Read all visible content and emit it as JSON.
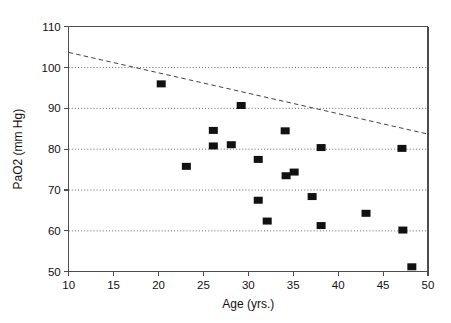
{
  "chart_data": {
    "type": "scatter",
    "title": "",
    "xlabel": "Age (yrs.)",
    "ylabel": "PaO2 (mm Hg)",
    "xlim": [
      10,
      50
    ],
    "ylim": [
      50,
      110
    ],
    "xticks": [
      10,
      15,
      20,
      25,
      30,
      35,
      40,
      45,
      50
    ],
    "xtick_labels": [
      "10",
      "15",
      "20",
      "25",
      "30",
      "35",
      "40",
      "45",
      "50"
    ],
    "yticks": [
      50,
      60,
      70,
      80,
      90,
      100,
      110
    ],
    "ytick_labels": [
      "50",
      "60",
      "70",
      "80",
      "90",
      "100",
      "110"
    ],
    "grid": "horizontal-dotted",
    "gridlines_y": [
      60,
      70,
      80,
      90,
      100
    ],
    "legend": null,
    "marker": "filled-square",
    "marker_color": "#111111",
    "points": [
      {
        "x": 20.3,
        "y": 96.0
      },
      {
        "x": 23.1,
        "y": 75.8
      },
      {
        "x": 26.1,
        "y": 84.6
      },
      {
        "x": 26.1,
        "y": 80.8
      },
      {
        "x": 28.1,
        "y": 81.1
      },
      {
        "x": 29.2,
        "y": 90.7
      },
      {
        "x": 31.1,
        "y": 77.5
      },
      {
        "x": 31.1,
        "y": 67.5
      },
      {
        "x": 32.1,
        "y": 62.4
      },
      {
        "x": 34.1,
        "y": 84.5
      },
      {
        "x": 34.2,
        "y": 73.5
      },
      {
        "x": 35.1,
        "y": 74.4
      },
      {
        "x": 37.1,
        "y": 68.4
      },
      {
        "x": 38.1,
        "y": 80.4
      },
      {
        "x": 38.1,
        "y": 61.3
      },
      {
        "x": 43.1,
        "y": 64.3
      },
      {
        "x": 47.1,
        "y": 80.2
      },
      {
        "x": 47.2,
        "y": 60.2
      },
      {
        "x": 48.2,
        "y": 51.2
      }
    ],
    "trendline": {
      "style": "dashed",
      "color": "#444444",
      "x0": 10,
      "y0": 103.7,
      "x1": 50,
      "y1": 83.7
    }
  }
}
